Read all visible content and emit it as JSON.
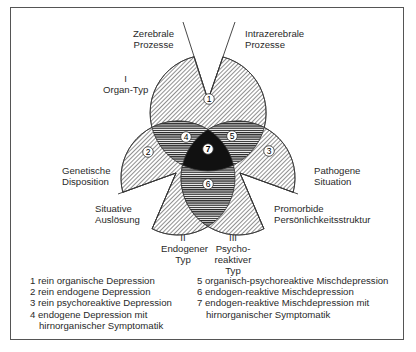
{
  "diagram": {
    "labels": {
      "zerebrale": [
        "Zerebrale",
        "Prozesse"
      ],
      "intrazerebrale": [
        "Intrazerebrale",
        "Prozesse"
      ],
      "organ_typ": [
        "I",
        "Organ-Typ"
      ],
      "genetische": [
        "Genetische",
        "Disposition"
      ],
      "situative": [
        "Situative",
        "Auslösung"
      ],
      "pathogene": [
        "Pathogene",
        "Situation"
      ],
      "promorbide": [
        "Promorbide",
        "Persönlichkeitsstruktur"
      ],
      "endogener": [
        "II",
        "Endogener",
        "Typ"
      ],
      "psychoreaktiver": [
        "III",
        "Psycho-",
        "reaktiver",
        "Typ"
      ]
    },
    "region_numbers": [
      "1",
      "2",
      "3",
      "4",
      "5",
      "6",
      "7"
    ]
  },
  "legend": {
    "left": [
      {
        "text": "1 rein organische Depression"
      },
      {
        "text": "2 rein endogene Depression"
      },
      {
        "text": "3 rein psychoreaktive Depression"
      },
      {
        "text": "4 endogene Depression mit",
        "cont": "hirnorganischer Symptomatik"
      }
    ],
    "right": [
      {
        "text": "5 organisch-psychoreaktive Mischdepression"
      },
      {
        "text": "6 endogen-reaktive Mischdepression"
      },
      {
        "text": "7 endogen-reaktive Mischdepression mit",
        "cont": "hirnorganischer Symptomatik"
      }
    ]
  }
}
